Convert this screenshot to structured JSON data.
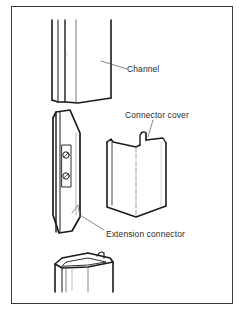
{
  "diagram": {
    "type": "exploded-assembly",
    "parts": [
      {
        "id": "channel",
        "label": "Channel"
      },
      {
        "id": "connector-cover",
        "label": "Connector cover"
      },
      {
        "id": "extension-connector",
        "label": "Extension connector"
      },
      {
        "id": "lower-channel",
        "label": ""
      }
    ],
    "colors": {
      "line": "#1a1a1a",
      "leader": "#555555",
      "frame": "#3a3a3a",
      "background": "#ffffff"
    }
  },
  "labels": {
    "channel": "Channel",
    "connector_cover": "Connector cover",
    "extension_connector": "Extension connector"
  }
}
